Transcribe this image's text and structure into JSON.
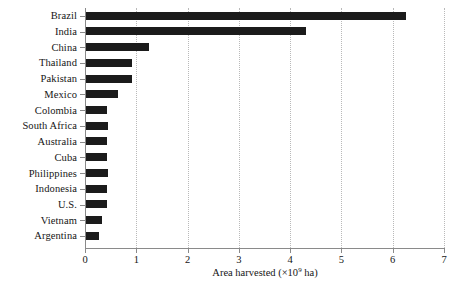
{
  "chart_data": {
    "type": "bar",
    "orientation": "horizontal",
    "title": "",
    "xlabel_text": "Area harvested (",
    "xlabel_multiplier": "×10",
    "xlabel_exponent": "9",
    "xlabel_unit": " ha)",
    "xlabel": "Area harvested (×10⁹ ha)",
    "ylabel": "",
    "xlim": [
      0,
      7
    ],
    "xticks": [
      0,
      1,
      2,
      3,
      4,
      5,
      6,
      7
    ],
    "xtick_labels": [
      "0",
      "1",
      "2",
      "3",
      "4",
      "5",
      "6",
      "7"
    ],
    "grid": "vertical-dotted",
    "legend": "none",
    "categories": [
      "Brazil",
      "India",
      "China",
      "Thailand",
      "Pakistan",
      "Mexico",
      "Colombia",
      "South Africa",
      "Australia",
      "Cuba",
      "Philippines",
      "Indonesia",
      "U.S.",
      "Vietnam",
      "Argentina"
    ],
    "values": [
      6.25,
      4.3,
      1.25,
      0.92,
      0.92,
      0.65,
      0.42,
      0.45,
      0.42,
      0.42,
      0.45,
      0.42,
      0.42,
      0.33,
      0.28
    ],
    "bar_color": "#1b1b1b",
    "grid_color": "#b9b9b9",
    "axis_color": "#8a8a8a",
    "background_color": "#ffffff"
  }
}
